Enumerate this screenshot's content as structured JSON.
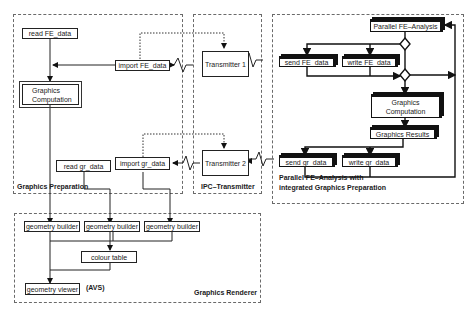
{
  "panels": {
    "graphics_preparation": {
      "label": "Graphics   Preparation"
    },
    "ipc_transmitter": {
      "label": "IPC–Transmitter"
    },
    "parallel_fe": {
      "label_line1": "Parallel  FE–Analysis  with",
      "label_line2": "integrated   Graphics  Preparation"
    },
    "graphics_renderer": {
      "label": "Graphics  Renderer"
    }
  },
  "boxes": {
    "read_fe_data": "read  FE_data",
    "import_fe_data": "import  FE_data",
    "graphics_computation_left": "Graphics Computation",
    "read_gr_data": "read  gr_data",
    "import_gr_data": "import  gr_data",
    "transmitter_1": "Transmitter  1",
    "transmitter_2": "Transmitter  2",
    "parallel_fe_analysis": "Parallel FE–Analysis",
    "send_fe_data": "send  FE_data",
    "write_fe_data": "write  FE_data",
    "graphics_computation_right": "Graphics Computation",
    "graphics_results": "Graphics Results",
    "send_gr_data": "send  gr_data",
    "write_gr_data": "write  gr_data",
    "geometry_builder_1": "geometry builder",
    "geometry_builder_2": "geometry builder",
    "geometry_builder_3": "geometry builder",
    "colour_table": "colour table",
    "geometry_viewer": "geometry  viewer"
  },
  "notes": {
    "avs": "(AVS)"
  }
}
